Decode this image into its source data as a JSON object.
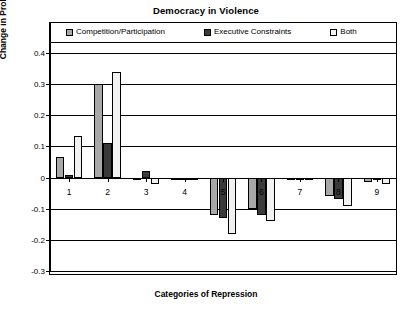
{
  "chart_data": {
    "type": "bar",
    "title": "Democracy in Violence",
    "xlabel": "Categories of Repression",
    "ylabel": "Change in Probability of Repression",
    "categories": [
      "1",
      "2",
      "3",
      "4",
      "5",
      "6",
      "7",
      "8",
      "9"
    ],
    "ylim": [
      -0.3,
      0.4
    ],
    "ytick_labels": [
      "0.4",
      "0.3",
      "0.2",
      "0.1",
      "0",
      "-0.1",
      "-0.2",
      "-0.3"
    ],
    "ytick_values": [
      0.4,
      0.3,
      0.2,
      0.1,
      0,
      -0.1,
      -0.2,
      -0.3
    ],
    "grid": true,
    "legend_position": "top",
    "series": [
      {
        "name": "Competition/Participation",
        "color": "#a8a8a8",
        "values": [
          0.065,
          0.3,
          0.0,
          -0.005,
          -0.12,
          -0.1,
          -0.005,
          -0.06,
          -0.015
        ]
      },
      {
        "name": "Executive Constraints",
        "color": "#3a3a3a",
        "values": [
          0.008,
          0.11,
          0.02,
          -0.004,
          -0.13,
          -0.12,
          -0.004,
          -0.07,
          -0.008
        ]
      },
      {
        "name": "Both",
        "color": "#f2f2f2",
        "values": [
          0.135,
          0.34,
          -0.02,
          -0.006,
          -0.18,
          -0.14,
          -0.008,
          -0.09,
          -0.02
        ]
      }
    ]
  },
  "legend": {
    "entries": [
      {
        "label": "Competition/Participation",
        "swatch": "#a8a8a8"
      },
      {
        "label": "Executive Constraints",
        "swatch": "#3a3a3a"
      },
      {
        "label": "Both",
        "swatch": "#f2f2f2"
      }
    ]
  }
}
